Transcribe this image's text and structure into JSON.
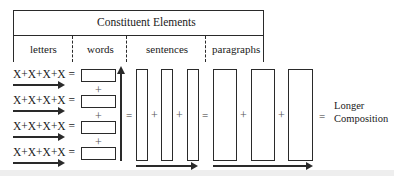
{
  "header": {
    "title": "Constituent Elements",
    "columns": [
      {
        "id": "letters",
        "label": "letters"
      },
      {
        "id": "words",
        "label": "words"
      },
      {
        "id": "sentences",
        "label": "sentences"
      },
      {
        "id": "paragraphs",
        "label": "paragraphs"
      }
    ]
  },
  "letters": {
    "rows": [
      {
        "expression": "X+X+X+X =",
        "arrow": "right-arrow"
      },
      {
        "expression": "X+X+X+X =",
        "arrow": "right-arrow"
      },
      {
        "expression": "X+X+X+X =",
        "arrow": "right-arrow"
      },
      {
        "expression": "X+X+X+X =",
        "arrow": "right-arrow"
      }
    ]
  },
  "operators": {
    "plus": "+",
    "equals": "="
  },
  "words": {
    "count": 4,
    "arrow": "up-arrow"
  },
  "sentences": {
    "count": 3,
    "arrow": "right-arrow"
  },
  "paragraphs": {
    "count": 3,
    "arrow": "right-arrow"
  },
  "result": {
    "line1": "Longer",
    "line2": "Composition"
  },
  "colors": {
    "stroke": "#2a2a2a",
    "background": "#ffffff",
    "bottom_band": "#eeeeee"
  }
}
